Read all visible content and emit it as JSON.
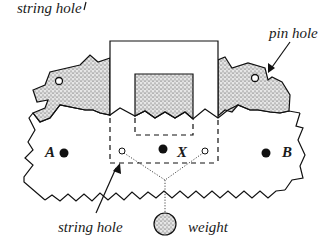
{
  "diagram": {
    "title": "",
    "labels": {
      "string_hole_top": "string hole",
      "pin_hole": "pin hole",
      "string_hole_bottom": "string hole",
      "weight": "weight",
      "point_a": "A",
      "point_b": "B",
      "point_x": "X"
    },
    "colors": {
      "stroke": "#111111",
      "stipple_fill": "#d8d8d8",
      "stipple_dot": "#222222",
      "background": "#ffffff"
    },
    "elements": [
      "cardboard-shape-with-zigzag-edges",
      "stippled-left-lobe-with-pin-hole",
      "stippled-right-lobe-with-pin-hole",
      "open-rectangle-cutout-top",
      "stippled-center-tab",
      "dashed-rectangle-region",
      "two-string-holes",
      "center-of-mass-point-X",
      "reference-points-A-and-B",
      "dotted-strings-to-weight",
      "stippled-weight-ball"
    ]
  }
}
